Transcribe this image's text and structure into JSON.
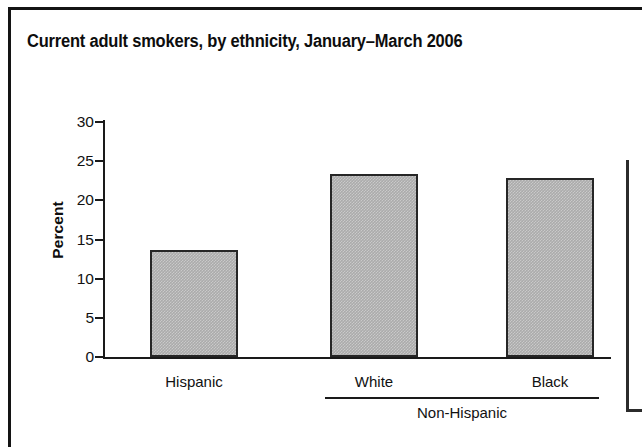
{
  "figure": {
    "title": "Current adult smokers, by ethnicity, January–March 2006",
    "frame_color": "#141414",
    "bar_fill_color": "#ababab",
    "bar_border_color": "#262626",
    "axis_color": "#1a1a1a"
  },
  "chart_data": {
    "type": "bar",
    "title": "Current adult smokers, by ethnicity, January–March 2006",
    "xlabel": "",
    "ylabel": "Percent",
    "ylim": [
      0,
      30
    ],
    "yticks": [
      0,
      5,
      10,
      15,
      20,
      25,
      30
    ],
    "ytick_labels": [
      "0",
      "5",
      "10",
      "15",
      "20",
      "25",
      "30"
    ],
    "grid": false,
    "legend": false,
    "categories": [
      "Hispanic",
      "White",
      "Black"
    ],
    "values": [
      13.7,
      23.4,
      22.9
    ],
    "groups": [
      {
        "label": "",
        "categories": [
          "Hispanic"
        ]
      },
      {
        "label": "Non-Hispanic",
        "categories": [
          "White",
          "Black"
        ]
      }
    ],
    "group_bracket_label": "Non-Hispanic"
  }
}
